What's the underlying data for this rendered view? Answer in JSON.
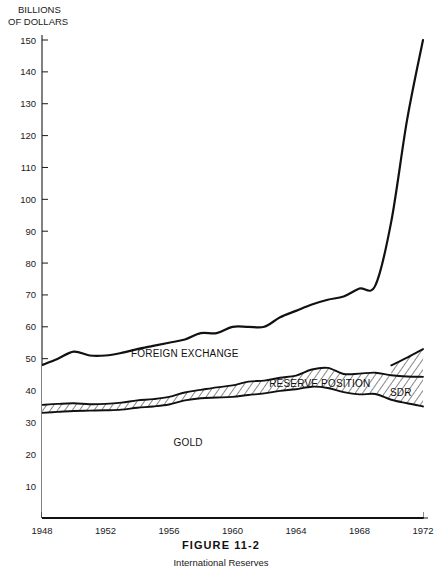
{
  "figure": {
    "number": "FIGURE 11-2",
    "caption": "International Reserves"
  },
  "chart_data": {
    "type": "area",
    "title": "International Reserves",
    "subtitle": "FIGURE 11-2",
    "ylabel_line1": "BILLIONS",
    "ylabel_line2": "OF DOLLARS",
    "xlabel": "",
    "xlim": [
      1948,
      1972
    ],
    "ylim": [
      0,
      150
    ],
    "grid": false,
    "legend_position": "inline-annotations",
    "y_ticks": [
      10,
      20,
      30,
      40,
      50,
      60,
      70,
      80,
      90,
      100,
      110,
      120,
      130,
      140,
      150
    ],
    "x_ticks": [
      1948,
      1950,
      1952,
      1954,
      1956,
      1958,
      1960,
      1962,
      1964,
      1966,
      1968,
      1970,
      1972
    ],
    "x_tick_labels": [
      1948,
      1952,
      1956,
      1960,
      1964,
      1968,
      1972
    ],
    "x": [
      1948,
      1949,
      1950,
      1951,
      1952,
      1953,
      1954,
      1955,
      1956,
      1957,
      1958,
      1959,
      1960,
      1961,
      1962,
      1963,
      1964,
      1965,
      1966,
      1967,
      1968,
      1969,
      1970,
      1971,
      1972
    ],
    "series": [
      {
        "name": "GOLD",
        "label": "GOLD",
        "fill": "#ffffff",
        "values": [
          33.0,
          33.3,
          33.6,
          33.7,
          33.8,
          34.0,
          34.6,
          35.0,
          35.6,
          36.9,
          37.6,
          37.8,
          38.0,
          38.6,
          39.1,
          39.9,
          40.4,
          41.2,
          40.8,
          39.5,
          38.8,
          38.9,
          37.1,
          36.0,
          35.0
        ]
      },
      {
        "name": "RESERVE POSITION",
        "label": "RESERVE POSITION",
        "fill": "#ffffff",
        "hatch": true,
        "values": [
          2.5,
          2.5,
          2.4,
          2.0,
          2.0,
          2.2,
          2.3,
          2.3,
          2.4,
          2.5,
          2.6,
          3.2,
          3.6,
          4.2,
          4.0,
          4.1,
          4.3,
          5.4,
          6.3,
          5.7,
          6.5,
          6.7,
          7.7,
          8.4,
          9.3
        ]
      },
      {
        "name": "SDR",
        "label": "SDR",
        "fill": "#ffffff",
        "hatch": true,
        "values": [
          0,
          0,
          0,
          0,
          0,
          0,
          0,
          0,
          0,
          0,
          0,
          0,
          0,
          0,
          0,
          0,
          0,
          0,
          0,
          0,
          0,
          0,
          3.1,
          5.9,
          8.7
        ]
      },
      {
        "name": "FOREIGN EXCHANGE",
        "label": "FOREIGN EXCHANGE",
        "fill": "#ffffff",
        "values": [
          12.5,
          14.2,
          16.2,
          15.3,
          15.2,
          15.6,
          16.1,
          16.7,
          17.0,
          16.6,
          17.8,
          17.0,
          18.4,
          17.2,
          16.9,
          19.0,
          20.3,
          20.4,
          21.4,
          24.3,
          26.7,
          27.4,
          45.1,
          74.7,
          97.0
        ]
      }
    ],
    "total_label": "Total international reserves",
    "annotations": [
      {
        "text": "FOREIGN EXCHANGE",
        "x": 1957.0,
        "y": 50.5
      },
      {
        "text": "RESERVE POSITION",
        "x": 1965.5,
        "y": 41.0
      },
      {
        "text": "SDR",
        "x": 1970.6,
        "y": 38.3
      },
      {
        "text": "GOLD",
        "x": 1957.2,
        "y": 22.5
      }
    ],
    "endpoints": {
      "total_1948": 48.0,
      "total_1972": 150.0,
      "gold_1948": 33.0,
      "gold_1972": 35.0
    }
  }
}
